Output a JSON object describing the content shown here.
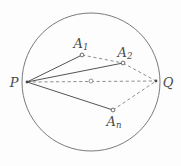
{
  "figure": {
    "type": "geometry-diagram",
    "width": 181,
    "height": 166,
    "background_color": "#fdfdfd",
    "stroke_color": "#4a4a4a",
    "circle_stroke_color": "#6b6b6b",
    "dash_stroke_color": "#7a7a7a",
    "marker_fill": "#fdfdfd"
  },
  "circle": {
    "name": "bounding-circle",
    "cx": 91,
    "cy": 82,
    "r": 69,
    "stroke_width": 0.9
  },
  "center_marker": {
    "name": "circle-center-marker",
    "cx": 91,
    "cy": 81,
    "r": 2.0
  },
  "points": [
    {
      "id": "P",
      "label": "P",
      "sub": "",
      "x": 27,
      "y": 82,
      "label_x": 14,
      "label_y": 82,
      "marker": false
    },
    {
      "id": "Q",
      "label": "Q",
      "sub": "",
      "x": 156,
      "y": 81,
      "label_x": 168,
      "label_y": 82,
      "marker": false
    },
    {
      "id": "A1",
      "label": "A",
      "sub": "1",
      "x": 82,
      "y": 55,
      "label_x": 81,
      "label_y": 43,
      "marker": true
    },
    {
      "id": "A2",
      "label": "A",
      "sub": "2",
      "x": 123,
      "y": 63,
      "label_x": 125,
      "label_y": 52,
      "marker": true
    },
    {
      "id": "An",
      "label": "A",
      "sub": "n",
      "x": 113,
      "y": 110,
      "label_x": 114,
      "label_y": 121,
      "marker": true
    }
  ],
  "solid_edges": [
    {
      "name": "edge-P-A1",
      "from": "P",
      "to": "A1",
      "x1": 27,
      "y1": 82,
      "x2": 82,
      "y2": 55
    },
    {
      "name": "edge-P-A2",
      "from": "P",
      "to": "A2",
      "x1": 27,
      "y1": 82,
      "x2": 123,
      "y2": 63
    },
    {
      "name": "edge-P-An",
      "from": "P",
      "to": "An",
      "x1": 27,
      "y1": 82,
      "x2": 113,
      "y2": 110
    }
  ],
  "dashed_edges": [
    {
      "name": "edge-P-Q",
      "from": "P",
      "to": "Q",
      "x1": 27,
      "y1": 82,
      "x2": 156,
      "y2": 81
    },
    {
      "name": "edge-A1-A2",
      "from": "A1",
      "to": "A2",
      "x1": 82,
      "y1": 55,
      "x2": 123,
      "y2": 63
    },
    {
      "name": "edge-A2-Q",
      "from": "A2",
      "to": "Q",
      "x1": 123,
      "y1": 63,
      "x2": 156,
      "y2": 81
    },
    {
      "name": "edge-An-Q",
      "from": "An",
      "to": "Q",
      "x1": 113,
      "y1": 110,
      "x2": 156,
      "y2": 81
    }
  ],
  "vertex_markers": [
    {
      "name": "vertex-marker-A1",
      "cx": 82,
      "cy": 55,
      "r": 1.9
    },
    {
      "name": "vertex-marker-A2",
      "cx": 123,
      "cy": 63,
      "r": 1.9
    },
    {
      "name": "vertex-marker-An",
      "cx": 113,
      "cy": 110,
      "r": 1.9
    }
  ]
}
